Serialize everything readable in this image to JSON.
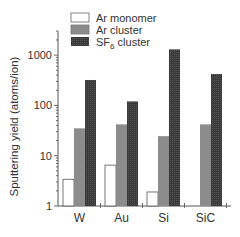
{
  "chart_data": {
    "type": "bar",
    "title": "",
    "xlabel": "",
    "ylabel": "Sputtering yield (atoms/ion)",
    "yscale": "log",
    "ylim": [
      1,
      3000
    ],
    "yticks": [
      1,
      10,
      100,
      1000
    ],
    "ytick_labels": [
      "1",
      "10",
      "100",
      "1000"
    ],
    "categories": [
      "W",
      "Au",
      "Si",
      "SiC"
    ],
    "series": [
      {
        "name": "Ar monomer",
        "label_parts": [
          "Ar monomer"
        ],
        "fill": "#ffffff",
        "values": [
          3.4,
          6.5,
          1.9,
          null
        ]
      },
      {
        "name": "Ar cluster",
        "label_parts": [
          "Ar cluster"
        ],
        "fill": "#8c8c8c",
        "values": [
          35,
          42,
          24.5,
          42
        ]
      },
      {
        "name": "SF6 cluster",
        "label_parts": [
          "SF",
          "6",
          " cluster"
        ],
        "fill": "#3a3a3a",
        "values": [
          320,
          120,
          1300,
          420
        ]
      }
    ],
    "legend_position": "top-left inside",
    "grid": false
  }
}
